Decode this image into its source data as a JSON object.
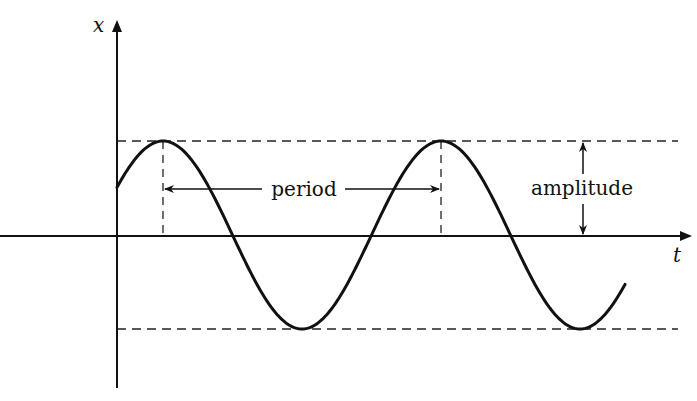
{
  "diagram": {
    "axes": {
      "vertical_label": "x",
      "horizontal_label": "t"
    },
    "annotations": {
      "period_label": "period",
      "amplitude_label": "amplitude"
    },
    "colors": {
      "ink": "#111111",
      "background": "#ffffff"
    }
  }
}
